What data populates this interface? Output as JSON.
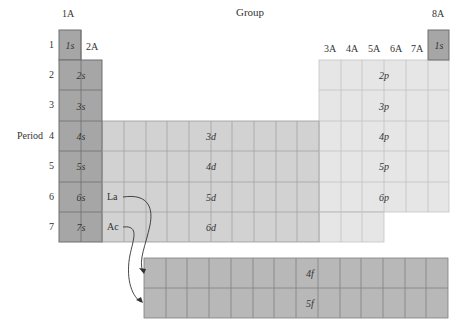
{
  "title": "Group",
  "axis_label_period": "Period",
  "group_labels": [
    {
      "label": "1A",
      "x": 69,
      "y": 13
    },
    {
      "label": "2A",
      "x": 86,
      "y": 46
    },
    {
      "label": "3A",
      "x": 330,
      "y": 48
    },
    {
      "label": "4A",
      "x": 352,
      "y": 48
    },
    {
      "label": "5A",
      "x": 374,
      "y": 48
    },
    {
      "label": "6A",
      "x": 396,
      "y": 48
    },
    {
      "label": "7A",
      "x": 417,
      "y": 48
    },
    {
      "label": "8A",
      "x": 438,
      "y": 13
    }
  ],
  "period_labels": [
    "1",
    "2",
    "3",
    "4",
    "5",
    "6",
    "7"
  ],
  "s_block": [
    "1s",
    "2s",
    "3s",
    "4s",
    "5s",
    "6s",
    "7s"
  ],
  "helium": "1s",
  "d_block": [
    "3d",
    "4d",
    "5d",
    "6d"
  ],
  "p_block": [
    "2p",
    "3p",
    "4p",
    "5p",
    "6p"
  ],
  "f_block": [
    "4f",
    "5f"
  ],
  "element_labels": {
    "la": "La",
    "ac": "Ac"
  },
  "colors": {
    "s": "#a6a6a6",
    "d": "#cfcfcf",
    "p": "#e6e6e6",
    "f": "#b8b8b8"
  }
}
